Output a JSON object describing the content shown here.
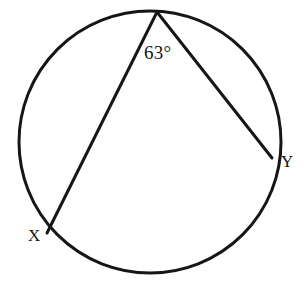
{
  "figure": {
    "kind": "inscribed-angle-circle-diagram",
    "background_color": "#ffffff",
    "stroke_color": "#161616",
    "width": 306,
    "height": 283
  },
  "circle": {
    "center_x": 150,
    "center_y": 142,
    "radius": 131,
    "stroke_width": 3
  },
  "points": {
    "apex": {
      "label": "",
      "x": 157,
      "y": 12
    },
    "x_point": {
      "label": "X",
      "x": 47,
      "y": 233
    },
    "y_point": {
      "label": "Y",
      "x": 272,
      "y": 158
    }
  },
  "chords": [
    {
      "name": "apex-to-x",
      "x1": 157,
      "y1": 12,
      "x2": 47,
      "y2": 233,
      "stroke_width": 3
    },
    {
      "name": "apex-to-y",
      "x1": 157,
      "y1": 12,
      "x2": 272,
      "y2": 158,
      "stroke_width": 3
    }
  ],
  "annotations": {
    "angle_measure": "63°",
    "angle_value": 63,
    "angle_unit": "degrees"
  },
  "chart_data": {
    "type": "diagram",
    "title": "",
    "labels": [
      "63°",
      "X",
      "Y"
    ]
  }
}
